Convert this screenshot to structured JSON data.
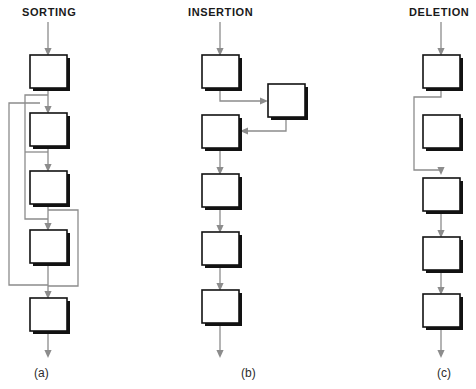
{
  "figure": {
    "type": "flowchart",
    "width": 476,
    "height": 389,
    "background": "#ffffff",
    "box_fill": "#ffffff",
    "box_stroke": "#121212",
    "connector_color": "#8c8c8c"
  },
  "columns": [
    {
      "id": "sorting",
      "title": "SORTING",
      "caption": "(a)",
      "title_x": 22,
      "title_y": 6,
      "caption_x": 34,
      "caption_y": 366,
      "box_count": 5,
      "boxes": [
        {
          "name": "sorting-box-1",
          "x": 30,
          "y": 55,
          "w": 37,
          "h": 33
        },
        {
          "name": "sorting-box-2",
          "x": 30,
          "y": 113,
          "w": 37,
          "h": 33
        },
        {
          "name": "sorting-box-3",
          "x": 30,
          "y": 171,
          "w": 37,
          "h": 33
        },
        {
          "name": "sorting-box-4",
          "x": 30,
          "y": 230,
          "w": 37,
          "h": 33
        },
        {
          "name": "sorting-box-5",
          "x": 30,
          "y": 298,
          "w": 37,
          "h": 33
        }
      ],
      "entry_arrow": {
        "from_y": 22,
        "to_y": 55,
        "x": 48
      },
      "exit_arrow": {
        "from_y": 331,
        "to_y": 357,
        "x": 48
      },
      "feedback_loops": [
        {
          "name": "feedback-box1-to-box4",
          "rail_x": 25,
          "from_y": 88,
          "to_y": 230
        },
        {
          "name": "feedback-box3-to-box5",
          "rail_x": 9,
          "from_y": 100,
          "to_y": 265
        },
        {
          "name": "feedback-box3-down-right",
          "rail_x": 78,
          "from_y": 204,
          "to_y": 298
        }
      ]
    },
    {
      "id": "insertion",
      "title": "INSERTION",
      "caption": "(b)",
      "title_x": 188,
      "title_y": 6,
      "caption_x": 241,
      "caption_y": 366,
      "box_count": 6,
      "boxes": [
        {
          "name": "insertion-box-1",
          "x": 202,
          "y": 55,
          "w": 37,
          "h": 33
        },
        {
          "name": "insertion-side-box",
          "x": 268,
          "y": 84,
          "w": 37,
          "h": 33
        },
        {
          "name": "insertion-box-2",
          "x": 202,
          "y": 115,
          "w": 37,
          "h": 33
        },
        {
          "name": "insertion-box-3",
          "x": 202,
          "y": 174,
          "w": 37,
          "h": 33
        },
        {
          "name": "insertion-box-4",
          "x": 202,
          "y": 232,
          "w": 37,
          "h": 33
        },
        {
          "name": "insertion-box-5",
          "x": 202,
          "y": 290,
          "w": 37,
          "h": 33
        }
      ],
      "entry_arrow": {
        "from_y": 22,
        "to_y": 55,
        "x": 220
      },
      "exit_arrow": {
        "from_y": 323,
        "to_y": 357,
        "x": 220
      },
      "detour": {
        "name": "insertion-side-detour",
        "out_from_y": 88,
        "out_mid_y": 101,
        "in_mid_y": 131,
        "side_x": 286
      }
    },
    {
      "id": "deletion",
      "title": "DELETION",
      "caption": "(c)",
      "title_x": 409,
      "title_y": 6,
      "caption_x": 437,
      "caption_y": 366,
      "box_count": 5,
      "boxes": [
        {
          "name": "deletion-box-1",
          "x": 423,
          "y": 55,
          "w": 37,
          "h": 33
        },
        {
          "name": "deletion-box-2-bypassed",
          "x": 423,
          "y": 115,
          "w": 37,
          "h": 33
        },
        {
          "name": "deletion-box-3",
          "x": 423,
          "y": 178,
          "w": 37,
          "h": 33
        },
        {
          "name": "deletion-box-4",
          "x": 423,
          "y": 237,
          "w": 37,
          "h": 33
        },
        {
          "name": "deletion-box-5",
          "x": 423,
          "y": 294,
          "w": 37,
          "h": 33
        }
      ],
      "entry_arrow": {
        "from_y": 22,
        "to_y": 55,
        "x": 441
      },
      "exit_arrow": {
        "from_y": 327,
        "to_y": 357,
        "x": 441
      },
      "bypass": {
        "name": "deletion-bypass",
        "rail_x": 414,
        "from_y": 88,
        "to_y": 178
      }
    }
  ]
}
